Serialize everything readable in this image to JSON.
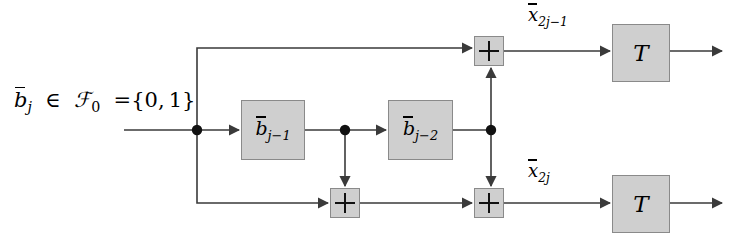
{
  "diagram": {
    "input_label": {
      "variable": "b",
      "overbar": true,
      "subscript": "j",
      "relation": "∈",
      "field": "F",
      "field_subscript": "0",
      "equals": "=",
      "set": "{0, 1}",
      "full_text": "b̄_j ∈ F_0 ={0,1}"
    },
    "delay_blocks": [
      {
        "name": "delay-b-j-minus-1",
        "variable": "b",
        "subscript": "j−1",
        "text": "b̄_{j−1}"
      },
      {
        "name": "delay-b-j-minus-2",
        "variable": "b",
        "subscript": "j−2",
        "text": "b̄_{j−2}"
      }
    ],
    "adders": [
      {
        "name": "adder-top-right",
        "symbol": "+"
      },
      {
        "name": "adder-bottom-left",
        "symbol": "+"
      },
      {
        "name": "adder-bottom-right",
        "symbol": "+"
      }
    ],
    "output_labels": [
      {
        "name": "output-label-odd",
        "variable": "x",
        "overbar": true,
        "subscript": "2j−1",
        "text": "x̄_{2j−1}"
      },
      {
        "name": "output-label-even",
        "variable": "x",
        "overbar": true,
        "subscript": "2j",
        "text": "x̄_{2j}"
      }
    ],
    "transform_blocks": [
      {
        "name": "transform-block-top",
        "symbol": "T"
      },
      {
        "name": "transform-block-bottom",
        "symbol": "T"
      }
    ],
    "junctions": [
      {
        "name": "junction-input-split",
        "x": 197,
        "y": 130
      },
      {
        "name": "junction-after-delay-1",
        "x": 345,
        "y": 130
      },
      {
        "name": "junction-after-delay-2",
        "x": 491,
        "y": 130
      }
    ],
    "colors": {
      "block_fill": "#cfcfcf",
      "block_border": "#8a8a8a",
      "wire": "#3a3a3a",
      "text": "#000000",
      "background": "#ffffff"
    }
  }
}
